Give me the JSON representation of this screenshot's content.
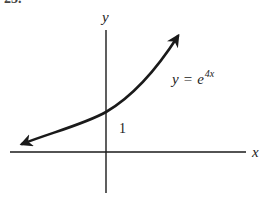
{
  "problem_number": "25.",
  "axes": {
    "x_label": "x",
    "y_label": "y"
  },
  "annotations": {
    "y_intercept_label": "1",
    "equation": {
      "lhs": "y",
      "equals": "=",
      "base": "e",
      "exponent": "4x"
    }
  },
  "curve": {
    "function": "y = e^(4x)",
    "description": "exponential growth curve with arrows at both ends, passing through (0,1)",
    "color": "#1a1a1a"
  },
  "colors": {
    "background": "#ffffff",
    "ink": "#1a1a1a"
  }
}
